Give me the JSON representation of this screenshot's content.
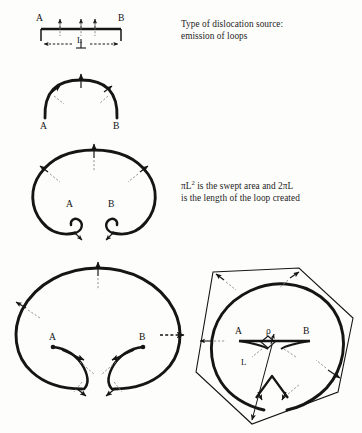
{
  "figure": {
    "title_text": "Type of dislocation source: emission of loops",
    "background_color": "#fdfdfc",
    "ink_color": "#151515"
  },
  "captions": {
    "source": {
      "line1": "Type of dislocation source:",
      "line2": "emission of loops"
    },
    "swept": {
      "line1_pre": "πL",
      "line1_sup": "2",
      "line1_post": " is the swept area and 2πL",
      "line2": "is the length of the loop created"
    }
  },
  "panels": [
    {
      "id": "panel-1-straight-segment",
      "name": "straight-dislocation-segment",
      "labels": {
        "left_pin": "A",
        "right_pin": "B",
        "length": "L"
      }
    },
    {
      "id": "panel-2-bowed-arc",
      "name": "bowed-out-arc",
      "labels": {
        "left_pin": "A",
        "right_pin": "B"
      }
    },
    {
      "id": "panel-3-horseshoe-loop",
      "name": "horseshoe-expanding-loop",
      "labels": {
        "left_pin": "A",
        "right_pin": "B"
      }
    },
    {
      "id": "panel-4-closed-loop",
      "name": "closed-loop-with-crossing-arms",
      "labels": {
        "left_pin": "A",
        "right_pin": "B"
      }
    },
    {
      "id": "panel-5-hexagon-loop",
      "name": "hexagonal-loop-with-radius",
      "labels": {
        "left_pin": "A",
        "right_pin": "B",
        "density": "ρ",
        "radius": "L"
      }
    }
  ],
  "transition_arrow": {
    "name": "panel4-to-panel5-arrow",
    "direction": "right"
  }
}
